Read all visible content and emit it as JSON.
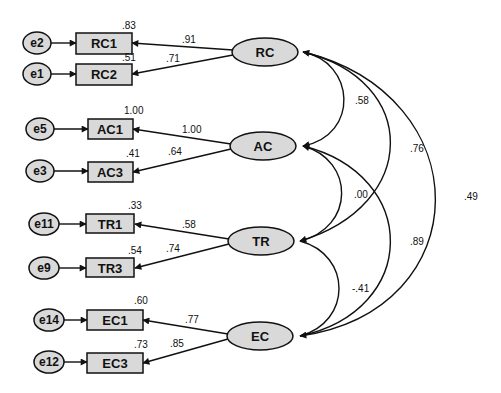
{
  "diagram": {
    "type": "structural_equation_model",
    "latent_factors": [
      {
        "id": "RC",
        "label": "RC"
      },
      {
        "id": "AC",
        "label": "AC"
      },
      {
        "id": "TR",
        "label": "TR"
      },
      {
        "id": "EC",
        "label": "EC"
      }
    ],
    "indicators": [
      {
        "label": "RC1",
        "error": "e2",
        "r2": ".83",
        "loading": ".91",
        "factor": "RC"
      },
      {
        "label": "RC2",
        "error": "e1",
        "r2": ".51",
        "loading": ".71",
        "factor": "RC"
      },
      {
        "label": "AC1",
        "error": "e5",
        "r2": "1.00",
        "loading": "1.00",
        "factor": "AC"
      },
      {
        "label": "AC3",
        "error": "e3",
        "r2": ".41",
        "loading": ".64",
        "factor": "AC"
      },
      {
        "label": "TR1",
        "error": "e11",
        "r2": ".33",
        "loading": ".58",
        "factor": "TR"
      },
      {
        "label": "TR3",
        "error": "e9",
        "r2": ".54",
        "loading": ".74",
        "factor": "TR"
      },
      {
        "label": "EC1",
        "error": "e14",
        "r2": ".60",
        "loading": ".77",
        "factor": "EC"
      },
      {
        "label": "EC3",
        "error": "e12",
        "r2": ".73",
        "loading": ".85",
        "factor": "EC"
      }
    ],
    "covariances": [
      {
        "from": "RC",
        "to": "AC",
        "value": ".58"
      },
      {
        "from": "RC",
        "to": "TR",
        "value": ".76"
      },
      {
        "from": "RC",
        "to": "EC",
        "value": ".49"
      },
      {
        "from": "AC",
        "to": "TR",
        "value": ".00"
      },
      {
        "from": "AC",
        "to": "EC",
        "value": ".89"
      },
      {
        "from": "TR",
        "to": "EC",
        "value": "-.41"
      }
    ]
  }
}
